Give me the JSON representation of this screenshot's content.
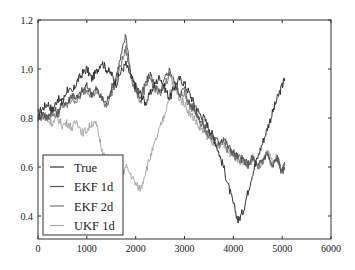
{
  "chart_data": {
    "type": "line",
    "title": "",
    "xlabel": "",
    "ylabel": "",
    "xlim": [
      0,
      6000
    ],
    "ylim": [
      0.306,
      1.2
    ],
    "grid": false,
    "legend_position": "lower left",
    "x_ticks": [
      "0",
      "1000",
      "2000",
      "3000",
      "4000",
      "5000",
      "6000"
    ],
    "y_ticks": [
      "0.4",
      "0.6",
      "0.8",
      "1.0",
      "1.2"
    ],
    "series": [
      {
        "name": "True",
        "color": "#333333",
        "x": [
          0,
          100,
          200,
          300,
          400,
          500,
          600,
          700,
          800,
          900,
          1000,
          1100,
          1200,
          1300,
          1400,
          1500,
          1600,
          1700,
          1800,
          1900,
          2000,
          2100,
          2200,
          2300,
          2400,
          2500,
          2600,
          2700,
          2800,
          2900,
          3000,
          3100,
          3200,
          3300,
          3400,
          3500,
          3600,
          3700,
          3800,
          3900,
          4000,
          4100,
          4200,
          4300,
          4400,
          4500,
          4600,
          4700,
          4800,
          4900,
          5000,
          5050
        ],
        "values": [
          0.82,
          0.84,
          0.86,
          0.83,
          0.88,
          0.86,
          0.92,
          0.9,
          0.95,
          0.98,
          1.0,
          0.96,
          0.99,
          1.03,
          1.0,
          0.98,
          0.94,
          0.99,
          1.02,
          0.97,
          0.93,
          0.9,
          0.86,
          0.9,
          0.94,
          0.97,
          0.92,
          0.88,
          0.93,
          0.96,
          0.94,
          0.9,
          0.86,
          0.82,
          0.8,
          0.76,
          0.72,
          0.66,
          0.6,
          0.52,
          0.45,
          0.38,
          0.42,
          0.5,
          0.58,
          0.64,
          0.7,
          0.76,
          0.82,
          0.88,
          0.93,
          0.96
        ]
      },
      {
        "name": "EKF 1d",
        "color": "#555555",
        "x": [
          0,
          100,
          200,
          300,
          400,
          500,
          600,
          700,
          800,
          900,
          1000,
          1100,
          1200,
          1300,
          1400,
          1500,
          1600,
          1700,
          1800,
          1900,
          2000,
          2100,
          2200,
          2300,
          2400,
          2500,
          2600,
          2700,
          2800,
          2900,
          3000,
          3100,
          3200,
          3300,
          3400,
          3500,
          3600,
          3700,
          3800,
          3900,
          4000,
          4100,
          4200,
          4300,
          4400,
          4500,
          4600,
          4700,
          4800,
          4900,
          5000,
          5050
        ],
        "values": [
          0.8,
          0.82,
          0.8,
          0.84,
          0.82,
          0.87,
          0.86,
          0.9,
          0.88,
          0.91,
          0.93,
          0.9,
          0.92,
          0.88,
          0.86,
          0.92,
          0.97,
          1.05,
          1.14,
          0.98,
          0.92,
          0.88,
          0.94,
          0.98,
          0.93,
          0.9,
          0.96,
          1.0,
          0.94,
          0.9,
          0.92,
          0.86,
          0.84,
          0.8,
          0.77,
          0.74,
          0.72,
          0.7,
          0.72,
          0.68,
          0.66,
          0.64,
          0.63,
          0.61,
          0.64,
          0.6,
          0.63,
          0.66,
          0.6,
          0.64,
          0.58,
          0.6
        ]
      },
      {
        "name": "EKF 2d",
        "color": "#777777",
        "x": [
          0,
          100,
          200,
          300,
          400,
          500,
          600,
          700,
          800,
          900,
          1000,
          1100,
          1200,
          1300,
          1400,
          1500,
          1600,
          1700,
          1800,
          1900,
          2000,
          2100,
          2200,
          2300,
          2400,
          2500,
          2600,
          2700,
          2800,
          2900,
          3000,
          3100,
          3200,
          3300,
          3400,
          3500,
          3600,
          3700,
          3800,
          3900,
          4000,
          4100,
          4200,
          4300,
          4400,
          4500,
          4600,
          4700,
          4800,
          4900,
          5000,
          5050
        ],
        "values": [
          0.8,
          0.81,
          0.8,
          0.82,
          0.81,
          0.85,
          0.85,
          0.88,
          0.87,
          0.9,
          0.92,
          0.89,
          0.91,
          0.88,
          0.85,
          0.9,
          0.95,
          1.02,
          1.08,
          0.97,
          0.91,
          0.87,
          0.92,
          0.96,
          0.92,
          0.89,
          0.94,
          0.98,
          0.93,
          0.89,
          0.9,
          0.85,
          0.83,
          0.79,
          0.76,
          0.73,
          0.71,
          0.69,
          0.7,
          0.67,
          0.65,
          0.63,
          0.62,
          0.61,
          0.63,
          0.6,
          0.62,
          0.65,
          0.6,
          0.63,
          0.57,
          0.62
        ]
      },
      {
        "name": "UKF 1d",
        "color": "#aaaaaa",
        "x": [
          0,
          100,
          200,
          300,
          400,
          500,
          600,
          700,
          800,
          900,
          1000,
          1100,
          1200,
          1300,
          1400,
          1500,
          1600,
          1700,
          1800,
          1900,
          2000,
          2100,
          2200,
          2300,
          2400,
          2500,
          2600,
          2700,
          2800,
          2900,
          3000,
          3100,
          3200,
          3300,
          3400,
          3500,
          3600,
          3700,
          3800,
          3900,
          4000,
          4100,
          4200,
          4300,
          4400,
          4500,
          4600,
          4700,
          4800,
          4900,
          5000,
          5050
        ],
        "values": [
          0.81,
          0.8,
          0.79,
          0.78,
          0.8,
          0.77,
          0.78,
          0.76,
          0.79,
          0.74,
          0.75,
          0.78,
          0.77,
          0.68,
          0.62,
          0.58,
          0.6,
          0.56,
          0.6,
          0.57,
          0.53,
          0.51,
          0.58,
          0.64,
          0.7,
          0.76,
          0.82,
          0.9,
          0.92,
          0.88,
          0.86,
          0.82,
          0.8,
          0.76,
          0.74,
          0.72,
          0.7,
          0.68,
          0.7,
          0.66,
          0.65,
          0.63,
          0.62,
          0.61,
          0.64,
          0.6,
          0.62,
          0.66,
          0.62,
          0.64,
          0.58,
          0.62
        ]
      }
    ]
  },
  "legend": {
    "items": [
      {
        "label": "True",
        "color": "#333333"
      },
      {
        "label": "EKF 1d",
        "color": "#555555"
      },
      {
        "label": "EKF 2d",
        "color": "#777777"
      },
      {
        "label": "UKF 1d",
        "color": "#aaaaaa"
      }
    ]
  }
}
